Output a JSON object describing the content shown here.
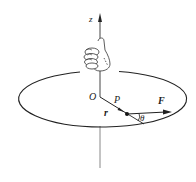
{
  "diagram": {
    "labels": {
      "axis": "z",
      "origin": "O",
      "point": "P",
      "radius": "r",
      "force": "F",
      "angle": "θ"
    },
    "colors": {
      "stroke": "#222222",
      "axis": "#555555"
    }
  }
}
